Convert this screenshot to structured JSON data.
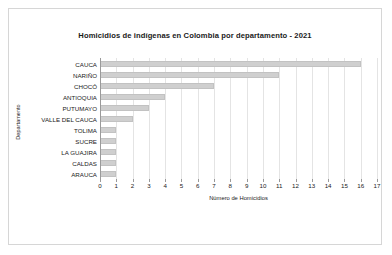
{
  "chart_data": {
    "type": "bar",
    "orientation": "horizontal",
    "title": "Homicidios de indígenas en Colombia por departamento - 2021",
    "xlabel": "Número de Homicidios",
    "ylabel": "Departamento",
    "categories": [
      "CAUCA",
      "NARIÑO",
      "CHOCÓ",
      "ANTIOQUIA",
      "PUTUMAYO",
      "VALLE DEL CAUCA",
      "TOLIMA",
      "SUCRE",
      "LA GUAJIRA",
      "CALDAS",
      "ARAUCA"
    ],
    "values": [
      16,
      11,
      7,
      4,
      3,
      2,
      1,
      1,
      1,
      1,
      1
    ],
    "xlim": [
      0,
      17
    ],
    "xticks": [
      0,
      1,
      2,
      3,
      4,
      5,
      6,
      7,
      8,
      9,
      10,
      11,
      12,
      13,
      14,
      15,
      16,
      17
    ],
    "xticklabels": [
      "0",
      "1",
      "2",
      "3",
      "4",
      "5",
      "6",
      "7",
      "8",
      "9",
      "10",
      "11",
      "12",
      "13",
      "14",
      "15",
      "16",
      "17"
    ],
    "grid": true,
    "grid_axis": "x",
    "legend": false,
    "bar_color": "#cfcfcf",
    "bar_edge_color": "#c2c2c2",
    "gridline_color": "#e4e4e4",
    "axis_color": "#9a9a9a",
    "text_color": "#1a1a1a",
    "background_color": "#ffffff",
    "frame_color": "#d6d6d6"
  }
}
